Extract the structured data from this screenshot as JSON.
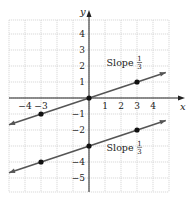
{
  "chart_data": {
    "type": "line",
    "title": "",
    "xlabel": "x",
    "ylabel": "y",
    "xlim": [
      -5,
      5
    ],
    "ylim": [
      -6,
      5
    ],
    "grid": true,
    "x_ticks": [
      {
        "value": -4,
        "label": "−4"
      },
      {
        "value": -3,
        "label": "−3"
      },
      {
        "value": 1,
        "label": "1"
      },
      {
        "value": 2,
        "label": "2"
      },
      {
        "value": 3,
        "label": "3"
      },
      {
        "value": 4,
        "label": "4"
      }
    ],
    "y_ticks": [
      {
        "value": 4,
        "label": "4"
      },
      {
        "value": 3,
        "label": "3"
      },
      {
        "value": 2,
        "label": "2"
      },
      {
        "value": 1,
        "label": "1"
      },
      {
        "value": -1,
        "label": "−1"
      },
      {
        "value": -2,
        "label": "−2"
      },
      {
        "value": -4,
        "label": "−4"
      },
      {
        "value": -5,
        "label": "−5"
      }
    ],
    "series": [
      {
        "name": "Line through origin",
        "equation": "y = x/3",
        "slope": "1/3",
        "points": [
          [
            -3,
            -1
          ],
          [
            0,
            0
          ],
          [
            3,
            1
          ]
        ],
        "segment": [
          [
            -5,
            -1.667
          ],
          [
            4.8,
            1.6
          ]
        ],
        "annotation": {
          "text": "Slope",
          "frac_num": "1",
          "frac_den": "3",
          "at": [
            1.1,
            2.0
          ]
        }
      },
      {
        "name": "Parallel line",
        "equation": "y = x/3 − 3",
        "slope": "1/3",
        "points": [
          [
            -3,
            -4
          ],
          [
            0,
            -3
          ],
          [
            3,
            -2
          ]
        ],
        "segment": [
          [
            -5,
            -4.667
          ],
          [
            4.8,
            -1.4
          ]
        ],
        "annotation": {
          "text": "Slope",
          "frac_num": "1",
          "frac_den": "3",
          "at": [
            1.1,
            -3.3
          ]
        }
      }
    ],
    "colors": {
      "line": "#555555",
      "point": "#111111",
      "grid": "#cfcfcf",
      "axis": "#222222"
    }
  }
}
